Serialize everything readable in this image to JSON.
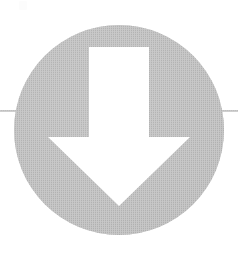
{
  "image": {
    "title": "Download arrow symbol",
    "description": "A solid gray filled circle containing a large white downward-pointing arrow, with a thin horizontal gray rule crossing the full image width behind the circle.",
    "width": 238,
    "height": 258,
    "background_color": "#ffffff"
  },
  "colors": {
    "background": "#ffffff",
    "circle_fill": "#b4b4b4",
    "circle_fill_light": "#c0c0c0",
    "arrow_fill": "#ffffff",
    "rule_line": "#a8a8a8",
    "speck": "#fcfcfc"
  },
  "shapes": {
    "circle": {
      "name": "gray-circle",
      "center_x": 119,
      "center_y": 130,
      "radius": 105,
      "fill": "#b4b4b4"
    },
    "arrow": {
      "name": "white-down-arrow",
      "fill": "#ffffff",
      "shaft_left": 89,
      "shaft_right": 149,
      "shaft_top": 47,
      "shoulder_y": 137,
      "wing_left": 48,
      "wing_right": 190,
      "wing_y": 140,
      "tip_x": 119,
      "tip_y": 206,
      "points": "89,47 149,47 149,137 190,137 119,206 48,137 89,137"
    },
    "rule": {
      "name": "horizontal-rule-line",
      "y": 111,
      "x_start": 0,
      "x_end": 238,
      "thickness": 1.6,
      "stroke": "#a8a8a8"
    },
    "speck": {
      "name": "scan-speck-artifact",
      "x": 19,
      "y": 1,
      "width": 8,
      "height": 9
    }
  },
  "labels": {
    "figure_caption": "",
    "alt_text": "Gray circle with white downward arrow"
  }
}
